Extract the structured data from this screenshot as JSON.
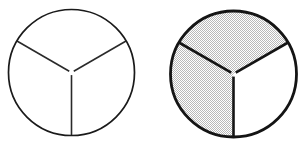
{
  "figure": {
    "background_color": "#ffffff",
    "line_color": "#1a1a1a",
    "shade_color": "#d0d0d0",
    "shade_pattern": "dither-checkerboard"
  },
  "chart_data": {
    "type": "pie",
    "xlabel": "",
    "ylabel": "",
    "legend": [],
    "charts": [
      {
        "name": "left-circle",
        "label": "",
        "center": [
          71.5,
          72.5
        ],
        "radius": 63,
        "outline_weight": "thin",
        "categories": [
          "top-left sector",
          "top-right sector",
          "bottom sector"
        ],
        "values": [
          1,
          1,
          1
        ],
        "fractions": [
          "1/3",
          "1/3",
          "1/3"
        ],
        "shaded": [
          false,
          false,
          false
        ],
        "shaded_count": 0,
        "total_sectors": 3,
        "fraction_shaded": "0/3",
        "sector_angles_deg": [
          120,
          120,
          120
        ],
        "divider_angles_deg": [
          90,
          210,
          330
        ]
      },
      {
        "name": "right-circle",
        "label": "",
        "center": [
          233.5,
          74.0
        ],
        "radius": 63,
        "outline_weight": "thick",
        "categories": [
          "top sector",
          "bottom-right sector",
          "bottom-left sector"
        ],
        "values": [
          1,
          1,
          1
        ],
        "fractions": [
          "1/3",
          "1/3",
          "1/3"
        ],
        "shaded": [
          true,
          true,
          false
        ],
        "shaded_count": 2,
        "total_sectors": 3,
        "fraction_shaded": "2/3",
        "sector_angles_deg": [
          120,
          120,
          120
        ],
        "divider_angles_deg": [
          90,
          210,
          330
        ]
      }
    ]
  }
}
